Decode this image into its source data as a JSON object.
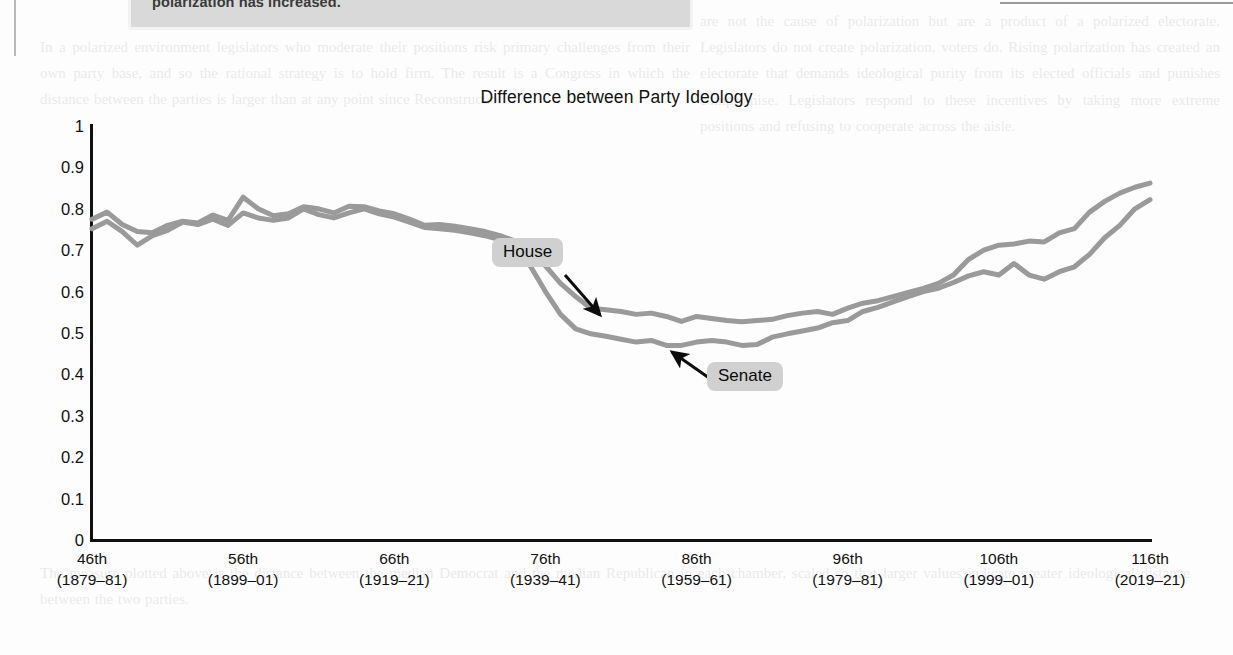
{
  "document": {
    "callout_text": "polarization has increased.",
    "ghost_text_right": "are not the cause of polarization but are a product of a polarized electorate. Legislators do not create polarization, voters do. Rising polarization has created an electorate that demands ideological purity from its elected officials and punishes compromise. Legislators respond to these incentives by taking more extreme positions and refusing to cooperate across the aisle.",
    "ghost_text_mid": "In a polarized environment legislators who moderate their positions risk primary challenges from their own party base, and so the rational strategy is to hold firm. The result is a Congress in which the distance between the parties is larger than at any point since Reconstruction.",
    "ghost_text_bottom": "The measure plotted above is the distance between the median Democrat and the median Republican in each chamber, scaled so that larger values indicate greater ideological distance between the two parties."
  },
  "chart_data": {
    "type": "line",
    "title": "Difference between Party Ideology",
    "xlabel": "",
    "ylabel": "",
    "ylim": [
      0,
      1
    ],
    "yticks": [
      "0",
      "0.1",
      "0.2",
      "0.3",
      "0.4",
      "0.5",
      "0.6",
      "0.7",
      "0.8",
      "0.9",
      "1"
    ],
    "ytick_values": [
      0,
      0.1,
      0.2,
      0.3,
      0.4,
      0.5,
      0.6,
      0.7,
      0.8,
      0.9,
      1
    ],
    "grid": false,
    "legend_position": "inline-annotations",
    "x_congress_start": 46,
    "x_congress_end": 116,
    "xticks": [
      {
        "congress": "46th",
        "years": "(1879–81)",
        "value": 46
      },
      {
        "congress": "56th",
        "years": "(1899–01)",
        "value": 56
      },
      {
        "congress": "66th",
        "years": "(1919–21)",
        "value": 66
      },
      {
        "congress": "76th",
        "years": "(1939–41)",
        "value": 76
      },
      {
        "congress": "86th",
        "years": "(1959–61)",
        "value": 86
      },
      {
        "congress": "96th",
        "years": "(1979–81)",
        "value": 96
      },
      {
        "congress": "106th",
        "years": "(1999–01)",
        "value": 106
      },
      {
        "congress": "116th",
        "years": "(2019–21)",
        "value": 116
      }
    ],
    "x": [
      46,
      47,
      48,
      49,
      50,
      51,
      52,
      53,
      54,
      55,
      56,
      57,
      58,
      59,
      60,
      61,
      62,
      63,
      64,
      65,
      66,
      67,
      68,
      69,
      70,
      71,
      72,
      73,
      74,
      75,
      76,
      77,
      78,
      79,
      80,
      81,
      82,
      83,
      84,
      85,
      86,
      87,
      88,
      89,
      90,
      91,
      92,
      93,
      94,
      95,
      96,
      97,
      98,
      99,
      100,
      101,
      102,
      103,
      104,
      105,
      106,
      107,
      108,
      109,
      110,
      111,
      112,
      113,
      114,
      115,
      116
    ],
    "series": [
      {
        "name": "House",
        "color": "#9a9a9a",
        "values": [
          0.775,
          0.792,
          0.762,
          0.745,
          0.742,
          0.76,
          0.77,
          0.766,
          0.785,
          0.772,
          0.828,
          0.8,
          0.783,
          0.788,
          0.805,
          0.8,
          0.79,
          0.806,
          0.805,
          0.795,
          0.788,
          0.775,
          0.76,
          0.762,
          0.758,
          0.752,
          0.745,
          0.735,
          0.722,
          0.7,
          0.662,
          0.62,
          0.588,
          0.56,
          0.556,
          0.552,
          0.545,
          0.548,
          0.54,
          0.528,
          0.54,
          0.535,
          0.53,
          0.527,
          0.53,
          0.533,
          0.542,
          0.548,
          0.552,
          0.545,
          0.56,
          0.572,
          0.578,
          0.588,
          0.598,
          0.608,
          0.62,
          0.64,
          0.678,
          0.7,
          0.712,
          0.715,
          0.722,
          0.72,
          0.742,
          0.752,
          0.792,
          0.818,
          0.838,
          0.852,
          0.862
        ]
      },
      {
        "name": "Senate",
        "color": "#9a9a9a",
        "values": [
          0.752,
          0.77,
          0.745,
          0.712,
          0.735,
          0.748,
          0.768,
          0.762,
          0.775,
          0.76,
          0.79,
          0.778,
          0.772,
          0.778,
          0.8,
          0.786,
          0.778,
          0.79,
          0.8,
          0.788,
          0.78,
          0.768,
          0.755,
          0.752,
          0.748,
          0.742,
          0.735,
          0.725,
          0.7,
          0.662,
          0.6,
          0.545,
          0.51,
          0.498,
          0.492,
          0.485,
          0.478,
          0.482,
          0.47,
          0.47,
          0.478,
          0.482,
          0.478,
          0.47,
          0.472,
          0.49,
          0.498,
          0.505,
          0.512,
          0.525,
          0.53,
          0.552,
          0.562,
          0.575,
          0.588,
          0.6,
          0.608,
          0.622,
          0.638,
          0.648,
          0.64,
          0.668,
          0.64,
          0.63,
          0.648,
          0.66,
          0.69,
          0.73,
          0.76,
          0.8,
          0.822
        ]
      }
    ],
    "annotations": [
      {
        "label": "House",
        "name": "house-annotation",
        "arrow_from": [
          565,
          275
        ],
        "arrow_to": [
          600,
          315
        ]
      },
      {
        "label": "Senate",
        "name": "senate-annotation",
        "arrow_from": [
          712,
          380
        ],
        "arrow_to": [
          672,
          352
        ]
      }
    ]
  }
}
